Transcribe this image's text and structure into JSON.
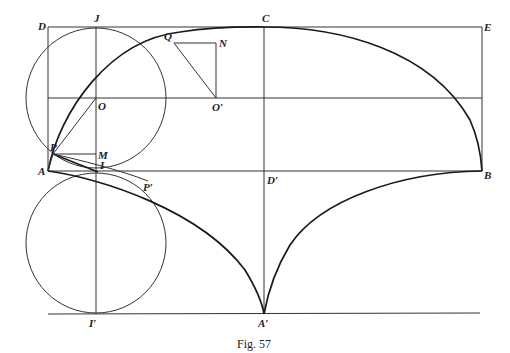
{
  "figure": {
    "caption": "Fig. 57",
    "labels": {
      "D": "D",
      "J": "J",
      "C": "C",
      "E": "E",
      "Q": "Q",
      "N": "N",
      "O": "O",
      "O_prime": "O′",
      "P": "P",
      "M": "M",
      "A": "A",
      "I": "I",
      "P_prime": "P′",
      "D_prime": "D′",
      "B": "B",
      "I_prime": "I′",
      "A_prime": "A′"
    }
  }
}
